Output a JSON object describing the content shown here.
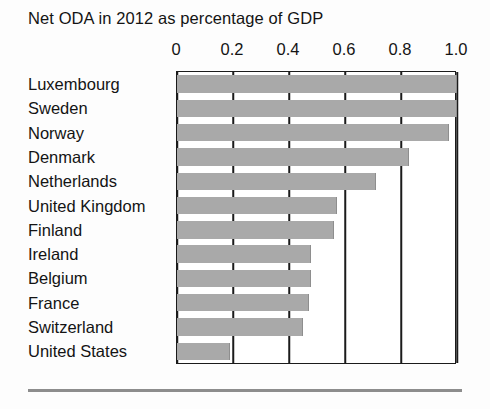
{
  "chart_data": {
    "type": "bar",
    "orientation": "horizontal",
    "title": "Net ODA in 2012 as percentage of GDP",
    "xlabel": "",
    "ylabel": "",
    "xlim": [
      0,
      1.0
    ],
    "xticks": [
      "0",
      "0.2",
      "0.4",
      "0.6",
      "0.8",
      "1.0"
    ],
    "xtick_values": [
      0,
      0.2,
      0.4,
      0.6,
      0.8,
      1.0
    ],
    "grid": true,
    "legend": null,
    "bar_color": "#a9a9a9",
    "categories": [
      "Luxembourg",
      "Sweden",
      "Norway",
      "Denmark",
      "Netherlands",
      "United Kingdom",
      "Finland",
      "Ireland",
      "Belgium",
      "France",
      "Switzerland",
      "United States"
    ],
    "values": [
      1.0,
      1.0,
      0.97,
      0.83,
      0.71,
      0.57,
      0.56,
      0.48,
      0.48,
      0.47,
      0.45,
      0.19
    ]
  },
  "footer": {
    "rule": true
  }
}
